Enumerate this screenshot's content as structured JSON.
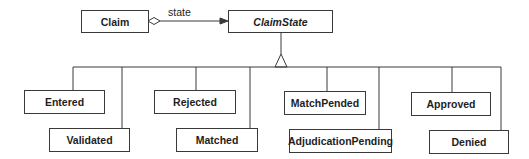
{
  "diagram": {
    "type": "UML class diagram (State pattern)",
    "context": {
      "name": "Claim"
    },
    "association": {
      "label": "state",
      "kind": "aggregation"
    },
    "abstract_state": {
      "name": "ClaimState"
    },
    "states": [
      {
        "name": "Entered"
      },
      {
        "name": "Validated"
      },
      {
        "name": "Rejected"
      },
      {
        "name": "Matched"
      },
      {
        "name": "MatchPended"
      },
      {
        "name": "AdjudicationPending"
      },
      {
        "name": "Approved"
      },
      {
        "name": "Denied"
      }
    ],
    "colors": {
      "line": "#3a3a3a",
      "text": "#1e1e1e",
      "background": "#ffffff"
    }
  }
}
